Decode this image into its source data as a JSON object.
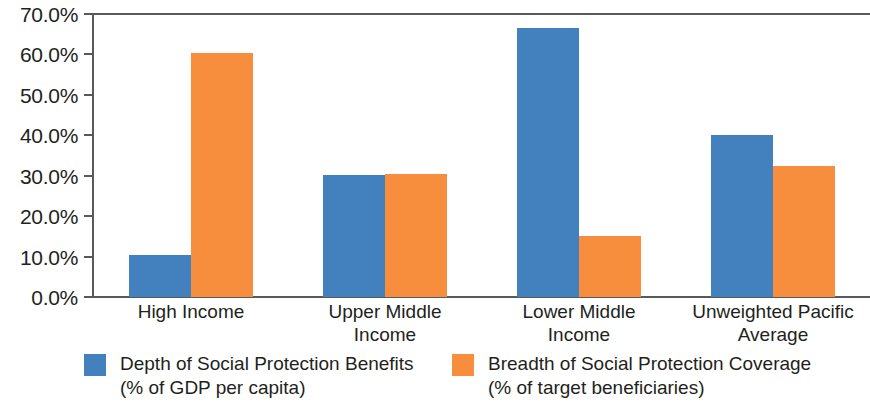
{
  "chart_data": {
    "type": "bar",
    "title": "",
    "subtitle": "",
    "xlabel": "",
    "ylabel": "",
    "ylim": [
      0,
      70
    ],
    "ytick_step": 10,
    "ytick_labels": [
      "70.0%",
      "60.0%",
      "50.0%",
      "40.0%",
      "30.0%",
      "20.0%",
      "10.0%",
      "0.0%"
    ],
    "ytick_values": [
      70,
      60,
      50,
      40,
      30,
      20,
      10,
      0
    ],
    "grid": false,
    "legend_position": "bottom",
    "categories": [
      "High Income",
      "Upper Middle Income",
      "Lower Middle Income",
      "Unweighted Pacific Average"
    ],
    "category_lines": [
      [
        "High Income"
      ],
      [
        "Upper Middle",
        "Income"
      ],
      [
        "Lower Middle",
        "Income"
      ],
      [
        "Unweighted Pacific",
        "Average"
      ]
    ],
    "series": [
      {
        "name": "Depth of Social Protection Benefits (% of GDP per capita)",
        "name_lines": [
          "Depth of Social Protection Benefits",
          "(% of GDP per capita)"
        ],
        "color": "#4281BD",
        "values": [
          10.5,
          30.2,
          66.5,
          40.0
        ]
      },
      {
        "name": "Breadth of Social Protection Coverage (% of target beneficiaries)",
        "name_lines": [
          "Breadth of Social Protection Coverage",
          "(% of target beneficiaries)"
        ],
        "color": "#F68E3E",
        "values": [
          60.3,
          30.4,
          15.1,
          32.5
        ]
      }
    ]
  }
}
